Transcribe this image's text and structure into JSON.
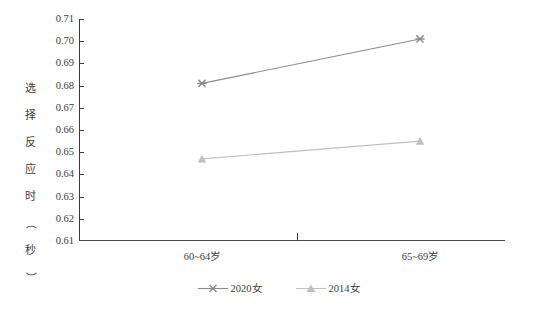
{
  "chart_data": {
    "type": "line",
    "title": "",
    "xlabel": "",
    "ylabel": "选择反应时（秒）",
    "categories": [
      "60~64岁",
      "65~69岁"
    ],
    "ylim": [
      0.61,
      0.71
    ],
    "yticks": [
      "0.71",
      "0.70",
      "0.69",
      "0.68",
      "0.67",
      "0.66",
      "0.65",
      "0.64",
      "0.63",
      "0.62",
      "0.61"
    ],
    "ytick_values": [
      0.71,
      0.7,
      0.69,
      0.68,
      0.67,
      0.66,
      0.65,
      0.64,
      0.63,
      0.62,
      0.61
    ],
    "grid": false,
    "legend_position": "bottom-center",
    "series": [
      {
        "name": "2020女",
        "values": [
          0.681,
          0.701
        ],
        "marker": "x-cross",
        "color": "#8c8c8c"
      },
      {
        "name": "2014女",
        "values": [
          0.647,
          0.655
        ],
        "marker": "triangle",
        "color": "#bfbfbf"
      }
    ]
  },
  "axis": {
    "y_title_chars": [
      "选",
      "择",
      "反",
      "应",
      "时",
      "（",
      "秒",
      "）"
    ],
    "y_ticks": [
      "0.71",
      "0.70",
      "0.69",
      "0.68",
      "0.67",
      "0.66",
      "0.65",
      "0.64",
      "0.63",
      "0.62",
      "0.61"
    ],
    "x_labels": [
      "60~64岁",
      "65~69岁"
    ]
  },
  "legend": {
    "items": [
      {
        "label": "2020女",
        "marker": "x-cross-marker",
        "color": "#8c8c8c"
      },
      {
        "label": "2014女",
        "marker": "triangle-marker",
        "color": "#bfbfbf"
      }
    ]
  },
  "colors": {
    "series_2020": "#8c8c8c",
    "series_2014": "#c2c2c2",
    "axis": "#3a3a3a",
    "text": "#3d3d3d",
    "background": "#ffffff"
  }
}
